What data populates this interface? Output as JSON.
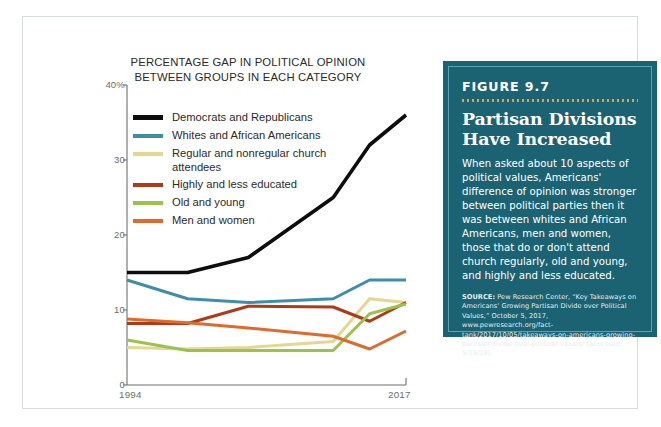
{
  "chart_data": {
    "type": "line",
    "title": "PERCENTAGE GAP IN POLITICAL OPINION\nBETWEEN GROUPS IN EACH CATEGORY",
    "xlabel": "",
    "ylabel": "",
    "xlim": [
      1994,
      2017
    ],
    "ylim": [
      0,
      40
    ],
    "grid": false,
    "legend_position": "upper-left-inside",
    "y_ticks": [
      "0",
      "10",
      "20",
      "30",
      "40%"
    ],
    "y_tick_values": [
      0,
      10,
      20,
      30,
      40
    ],
    "x_ticks": [
      "1994",
      "2017"
    ],
    "x_tick_values": [
      1994,
      2017
    ],
    "x": [
      1994,
      1999,
      2004,
      2011,
      2014,
      2017
    ],
    "series": [
      {
        "name": "Democrats and Republicans",
        "color": "#0d0d0d",
        "values": [
          15,
          15,
          17,
          25,
          32,
          36
        ]
      },
      {
        "name": "Whites and African Americans",
        "color": "#3d8fa8",
        "values": [
          14,
          11.5,
          11,
          11.5,
          14,
          14
        ]
      },
      {
        "name": "Regular and nonregular church\nattendees",
        "color": "#e6d68f",
        "values": [
          5,
          4.8,
          5,
          5.8,
          11.5,
          11
        ]
      },
      {
        "name": "Highly and less educated",
        "color": "#b03a17",
        "values": [
          8.2,
          8.2,
          10.5,
          10.4,
          8.5,
          11
        ]
      },
      {
        "name": "Old and young",
        "color": "#9dc24c",
        "values": [
          6,
          4.6,
          4.6,
          4.6,
          9.5,
          10.8
        ]
      },
      {
        "name": "Men and women",
        "color": "#e0692c",
        "values": [
          8.8,
          8.3,
          7.6,
          6.5,
          4.8,
          7.2
        ]
      }
    ]
  },
  "figure": {
    "number": "FIGURE 9.7",
    "headline": "Partisan Divisions\nHave Increased",
    "body": "When asked about 10 aspects of political values, Americans' difference of opinion was stronger between political parties then it was between whites and African Americans, men and women, those that do or don't attend church regularly, old and young, and highly and less educated.",
    "source_label": "SOURCE:",
    "source_text": " Pew Research Center, “Key Takeaways on Americans’ Growing Partisan Divide over Political Values,” October 5, 2017, www.pewresearch.org/fact-tank/2017/10/05/takeaways-on-americans-growing-partisan-divide-over-political-values/ (accessed 5/15/18).",
    "accent_color": "#1b6272",
    "rule_color": "#e9a23b",
    "border_color": "#60a2ac"
  }
}
